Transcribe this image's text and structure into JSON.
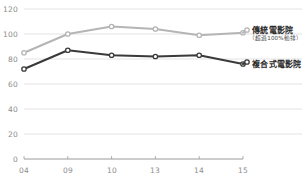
{
  "chart_data": {
    "type": "line",
    "title": "",
    "subtitle": "",
    "xlabel": "",
    "ylabel": "",
    "categories": [
      "04",
      "09",
      "10",
      "13",
      "14",
      "15"
    ],
    "ylim": [
      0,
      120
    ],
    "yticks": [
      0,
      20,
      40,
      60,
      80,
      100,
      120
    ],
    "grid": true,
    "legend_position": "right",
    "series": [
      {
        "name": "傳統電影院",
        "note": "（超過100%動排）",
        "color": "#b5b5b5",
        "marker": "circle-open",
        "values": [
          85,
          100,
          106,
          104,
          99,
          101
        ]
      },
      {
        "name": "複合式電影院",
        "note": "",
        "color": "#3a3a3a",
        "marker": "circle-open",
        "values": [
          72,
          87,
          83,
          82,
          83,
          76
        ]
      }
    ]
  },
  "axis": {
    "y_ticks": [
      "120",
      "100",
      "80",
      "60",
      "40",
      "20",
      "0"
    ],
    "x_ticks": [
      "04",
      "09",
      "10",
      "13",
      "14",
      "15"
    ]
  },
  "legend": {
    "traditional_label": "傳統電影院",
    "traditional_note": "（超過100%動排）",
    "multiplex_label": "複合式電影院"
  },
  "colors": {
    "traditional": "#b5b5b5",
    "multiplex": "#3a3a3a",
    "grid": "#e3e3e3",
    "axis_text": "#8c8c8c",
    "legend_text": "#2b2b2b"
  }
}
